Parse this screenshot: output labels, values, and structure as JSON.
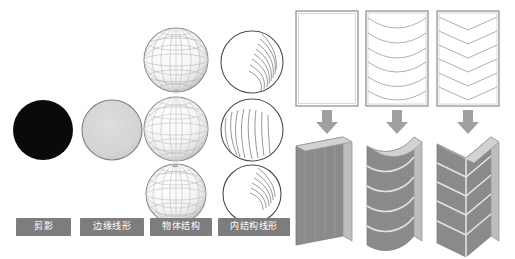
{
  "figure": {
    "type": "diagram",
    "background_color": "#ffffff",
    "title": "",
    "panels": [
      {
        "id": "left-panel",
        "name": "sphere-rendering-stages"
      },
      {
        "id": "right-panel",
        "name": "flat-to-3d-transformation"
      }
    ]
  },
  "left_panel": {
    "columns": [
      {
        "index": 0,
        "label": "剪影",
        "icon_name": "black-filled-circle",
        "shape_count": 1,
        "fill_color": "#0a0a0a",
        "stroke_color": "#0a0a0a",
        "description_name": "silhouette-circle"
      },
      {
        "index": 1,
        "label": "边缘线形",
        "icon_name": "gray-outlined-circle",
        "shape_count": 1,
        "fill_color": "#d3d3d3",
        "stroke_color": "#8a8a8a",
        "description_name": "edge-line-circle"
      },
      {
        "index": 2,
        "label": "物体结构",
        "icon_name": "wireframe-globe-sphere",
        "shape_count": 3,
        "fill_color": "#f2f2f2",
        "stroke_color": "#9a9a9a",
        "description_name": "object-structure-globe"
      },
      {
        "index": 3,
        "label": "内结构线形",
        "icon_name": "contour-hatched-circle",
        "shape_count": 3,
        "fill_color": "#ffffff",
        "stroke_color": "#555555",
        "description_name": "internal-structure-line-circle"
      }
    ],
    "badge_background": "#7d7d7d",
    "badge_text_color": "#ffffff"
  },
  "right_panel": {
    "arrow_color": "#9e9e9e",
    "arrow_count": 3,
    "slab_fill": "#8c8c8c",
    "slab_edge": "#b5b5b5",
    "sheet_stroke": "#808080",
    "groups": [
      {
        "index": 0,
        "sheet_name": "blank-flat-sheet",
        "sheet_pattern": "none",
        "line_count": 0,
        "arrow_name": "down-arrow",
        "solid_name": "flat-slab"
      },
      {
        "index": 1,
        "sheet_name": "curved-line-sheet",
        "sheet_pattern": "curved",
        "line_count": 6,
        "arrow_name": "down-arrow",
        "solid_name": "curved-slab"
      },
      {
        "index": 2,
        "sheet_name": "chevron-line-sheet",
        "sheet_pattern": "chevron",
        "line_count": 6,
        "arrow_name": "down-arrow",
        "solid_name": "faceted-slab"
      }
    ]
  }
}
